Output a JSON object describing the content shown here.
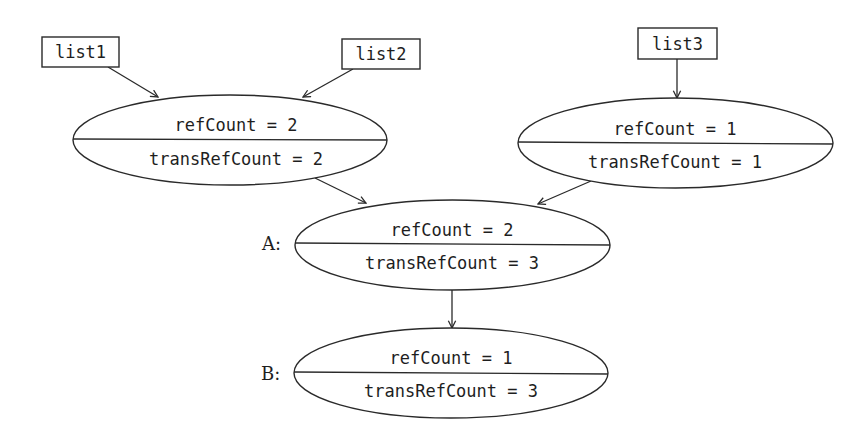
{
  "diagram": {
    "title": "",
    "lists": [
      {
        "id": "list1",
        "label": "list1"
      },
      {
        "id": "list2",
        "label": "list2"
      },
      {
        "id": "list3",
        "label": "list3"
      }
    ],
    "nodes": [
      {
        "id": "n1",
        "label": "",
        "refCount_text": "refCount = 2",
        "transRefCount_text": "transRefCount = 2",
        "refCount": 2,
        "transRefCount": 2
      },
      {
        "id": "n2",
        "label": "",
        "refCount_text": "refCount = 1",
        "transRefCount_text": "transRefCount = 1",
        "refCount": 1,
        "transRefCount": 1
      },
      {
        "id": "A",
        "label": "A:",
        "refCount_text": "refCount = 2",
        "transRefCount_text": "transRefCount = 3",
        "refCount": 2,
        "transRefCount": 3
      },
      {
        "id": "B",
        "label": "B:",
        "refCount_text": "refCount = 1",
        "transRefCount_text": "transRefCount = 3",
        "refCount": 1,
        "transRefCount": 3
      }
    ],
    "edges": [
      {
        "from": "list1",
        "to": "n1"
      },
      {
        "from": "list2",
        "to": "n1"
      },
      {
        "from": "list3",
        "to": "n2"
      },
      {
        "from": "n1",
        "to": "A"
      },
      {
        "from": "n2",
        "to": "A"
      },
      {
        "from": "A",
        "to": "B"
      }
    ],
    "colors": {
      "stroke": "#2a2a2a",
      "text": "#1e1e1e",
      "background": "#ffffff"
    }
  }
}
